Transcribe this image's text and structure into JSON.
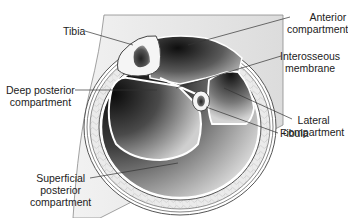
{
  "diagram": {
    "colors": {
      "background_panel": "#e8e8e8",
      "fat_layer": "#e4e4e4",
      "bone_cortex": "#f4f4f4",
      "marrow": "#3a3a3a",
      "compartment_dark": "#1a1a1a",
      "compartment_light": "#d0d0d0",
      "outline": "#555555",
      "leader_line": "#333333",
      "text": "#222222"
    },
    "labels": {
      "tibia": "Tibia",
      "anterior_line1": "Anterior",
      "anterior_line2": "compartment",
      "interosseous_line1": "Interosseous",
      "interosseous_line2": "membrane",
      "deep_posterior_line1": "Deep posterior",
      "deep_posterior_line2": "compartment",
      "lateral_line1": "Lateral",
      "lateral_line2": "compartment",
      "fibula": "Fibula",
      "superficial_line1": "Superficial",
      "superficial_line2": "posterior",
      "superficial_line3": "compartment"
    }
  }
}
